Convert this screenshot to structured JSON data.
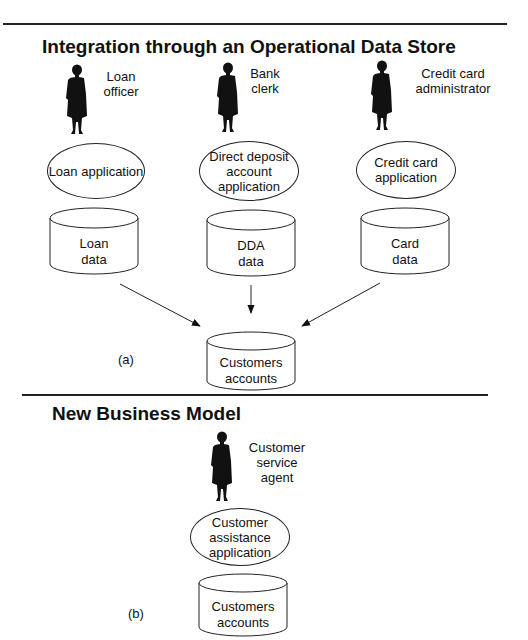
{
  "section_a": {
    "title": "Integration through an Operational Data Store",
    "part_label": "(a)",
    "roles": [
      {
        "line1": "Loan",
        "line2": "officer",
        "icon": "person-silhouette"
      },
      {
        "line1": "Bank",
        "line2": "clerk",
        "icon": "person-silhouette"
      },
      {
        "line1": "Credit card",
        "line2": "administrator",
        "icon": "person-silhouette"
      }
    ],
    "applications": [
      {
        "lines": [
          "Loan application"
        ]
      },
      {
        "lines": [
          "Direct deposit",
          "account",
          "application"
        ]
      },
      {
        "lines": [
          "Credit card",
          "application"
        ]
      }
    ],
    "data_stores": [
      {
        "line1": "Loan",
        "line2": "data"
      },
      {
        "line1": "DDA",
        "line2": "data"
      },
      {
        "line1": "Card",
        "line2": "data"
      }
    ],
    "central_store": {
      "line1": "Customers",
      "line2": "accounts"
    }
  },
  "section_b": {
    "title": "New Business Model",
    "part_label": "(b)",
    "role": {
      "line1": "Customer",
      "line2": "service",
      "line3": "agent",
      "icon": "person-silhouette"
    },
    "application": {
      "lines": [
        "Customer",
        "assistance",
        "application"
      ]
    },
    "data_store": {
      "line1": "Customers",
      "line2": "accounts"
    }
  },
  "colors": {
    "ink": "#111111",
    "background": "#ffffff"
  }
}
